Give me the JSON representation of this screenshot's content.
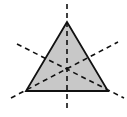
{
  "diagram": {
    "title": "",
    "shape": "equilateral-triangle",
    "fill": "#c8c8c8",
    "stroke": "#111111",
    "line_style": "dashed",
    "triangle": {
      "apex": [
        67,
        22
      ],
      "left": [
        26,
        91
      ],
      "right": [
        108,
        91
      ]
    },
    "symmetry_lines": [
      {
        "from": [
          67,
          4
        ],
        "to": [
          67,
          109
        ]
      },
      {
        "from": [
          17,
          44
        ],
        "to": [
          124,
          98
        ]
      },
      {
        "from": [
          11,
          98
        ],
        "to": [
          118,
          42
        ]
      }
    ]
  }
}
